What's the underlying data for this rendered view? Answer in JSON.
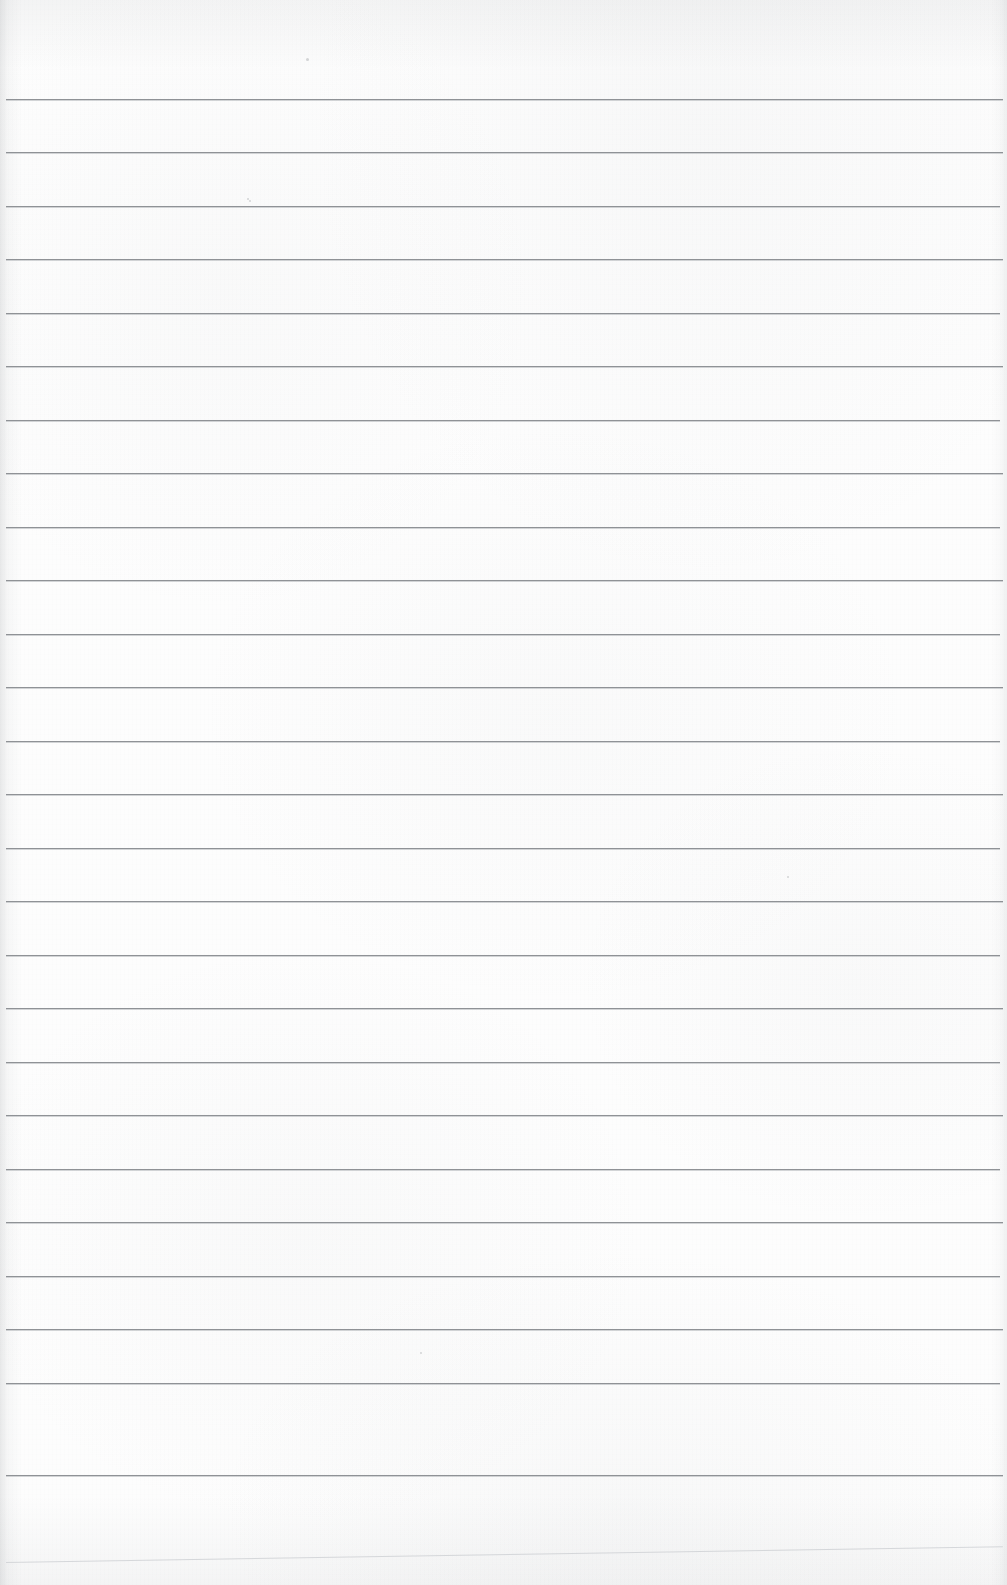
{
  "page": {
    "kind": "scanned-blank-ruled-notebook-page",
    "width": 1007,
    "height": 1585,
    "paper_color": "#fdfdfd",
    "rule_color": "#8f9296",
    "faint_rule_color": "#c9ccd0",
    "text_content": "",
    "handwriting_present": false,
    "printed_text_present": false
  },
  "ruling": {
    "line_count": 26,
    "first_line_y": 99,
    "spacing_px": 53.5,
    "line_thickness_px": 1,
    "left_margin_x": 6,
    "right_edge_x": 1003,
    "margin_rule_present": false,
    "holes_present": false
  },
  "lines": [
    {
      "y": 99,
      "x1": 6,
      "x2": 1003,
      "weight": "normal"
    },
    {
      "y": 152,
      "x1": 6,
      "x2": 1003,
      "weight": "normal"
    },
    {
      "y": 206,
      "x1": 6,
      "x2": 1000,
      "weight": "normal"
    },
    {
      "y": 259,
      "x1": 6,
      "x2": 1003,
      "weight": "normal"
    },
    {
      "y": 313,
      "x1": 6,
      "x2": 1000,
      "weight": "normal"
    },
    {
      "y": 366,
      "x1": 6,
      "x2": 1003,
      "weight": "normal"
    },
    {
      "y": 420,
      "x1": 6,
      "x2": 1000,
      "weight": "normal"
    },
    {
      "y": 473,
      "x1": 6,
      "x2": 1003,
      "weight": "normal"
    },
    {
      "y": 527,
      "x1": 6,
      "x2": 1000,
      "weight": "normal"
    },
    {
      "y": 580,
      "x1": 6,
      "x2": 1003,
      "weight": "normal"
    },
    {
      "y": 634,
      "x1": 6,
      "x2": 1000,
      "weight": "normal"
    },
    {
      "y": 687,
      "x1": 6,
      "x2": 1003,
      "weight": "normal"
    },
    {
      "y": 741,
      "x1": 6,
      "x2": 1000,
      "weight": "normal"
    },
    {
      "y": 794,
      "x1": 6,
      "x2": 1003,
      "weight": "normal"
    },
    {
      "y": 848,
      "x1": 6,
      "x2": 1000,
      "weight": "normal"
    },
    {
      "y": 901,
      "x1": 6,
      "x2": 1003,
      "weight": "normal"
    },
    {
      "y": 955,
      "x1": 6,
      "x2": 1000,
      "weight": "normal"
    },
    {
      "y": 1008,
      "x1": 6,
      "x2": 1003,
      "weight": "normal"
    },
    {
      "y": 1062,
      "x1": 6,
      "x2": 1000,
      "weight": "normal"
    },
    {
      "y": 1115,
      "x1": 6,
      "x2": 1003,
      "weight": "normal"
    },
    {
      "y": 1169,
      "x1": 6,
      "x2": 1000,
      "weight": "normal"
    },
    {
      "y": 1222,
      "x1": 6,
      "x2": 1003,
      "weight": "normal"
    },
    {
      "y": 1276,
      "x1": 6,
      "x2": 1000,
      "weight": "normal"
    },
    {
      "y": 1329,
      "x1": 6,
      "x2": 1003,
      "weight": "normal"
    },
    {
      "y": 1383,
      "x1": 6,
      "x2": 1000,
      "weight": "normal"
    },
    {
      "y": 1475,
      "x1": 6,
      "x2": 1003,
      "weight": "normal"
    },
    {
      "y": 1562,
      "x1": 6,
      "x2": 1003,
      "weight": "faint",
      "skew_deg": -0.9
    }
  ],
  "specks": [
    {
      "x": 306,
      "y": 58,
      "size": 3
    },
    {
      "x": 247,
      "y": 198,
      "size": 2
    },
    {
      "x": 249,
      "y": 200,
      "size": 2
    },
    {
      "x": 787,
      "y": 876,
      "size": 2
    },
    {
      "x": 420,
      "y": 1352,
      "size": 2
    }
  ]
}
